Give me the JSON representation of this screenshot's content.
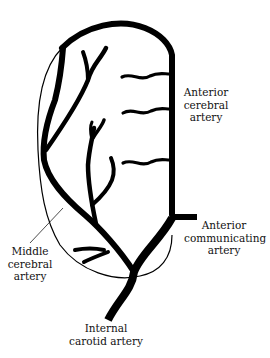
{
  "diagram": {
    "type": "anatomical vascular diagram",
    "ink_color": "#000000",
    "background_color": "#ffffff",
    "labels": {
      "anterior_cerebral": [
        "Anterior",
        "cerebral",
        "artery"
      ],
      "anterior_communicating": [
        "Anterior",
        "communicating",
        "artery"
      ],
      "middle_cerebral": [
        "Middle",
        "cerebral",
        "artery"
      ],
      "internal_carotid": [
        "Internal",
        "carotid artery"
      ]
    }
  }
}
